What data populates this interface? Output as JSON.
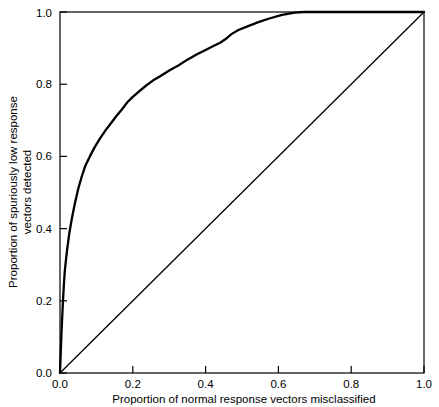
{
  "chart_data": {
    "type": "line",
    "title": "",
    "xlabel": "Proportion of normal response vectors misclassified",
    "ylabel": "Proportion of spuriously low response vectors detected",
    "ylabel_line1": "Proportion of spuriously low response",
    "ylabel_line2": "vectors detected",
    "xlim": [
      0.0,
      1.0
    ],
    "ylim": [
      0.0,
      1.0
    ],
    "grid": false,
    "legend": "none",
    "xticks": [
      "0.0",
      "0.2",
      "0.4",
      "0.6",
      "0.8",
      "1.0"
    ],
    "xtick_values": [
      0.0,
      0.2,
      0.4,
      0.6,
      0.8,
      1.0
    ],
    "yticks": [
      "0.0",
      "0.2",
      "0.4",
      "0.6",
      "0.8",
      "1.0"
    ],
    "ytick_values": [
      0.0,
      0.2,
      0.4,
      0.6,
      0.8,
      1.0
    ],
    "series": [
      {
        "name": "ROC curve",
        "x": [
          0.0,
          0.004,
          0.007,
          0.009,
          0.011,
          0.013,
          0.016,
          0.02,
          0.026,
          0.033,
          0.041,
          0.05,
          0.06,
          0.07,
          0.082,
          0.095,
          0.11,
          0.125,
          0.14,
          0.155,
          0.17,
          0.185,
          0.2,
          0.215,
          0.235,
          0.255,
          0.275,
          0.3,
          0.325,
          0.35,
          0.375,
          0.4,
          0.42,
          0.44,
          0.455,
          0.47,
          0.49,
          0.515,
          0.545,
          0.575,
          0.61,
          0.645,
          0.67,
          0.7,
          1.0
        ],
        "y": [
          0.0,
          0.11,
          0.175,
          0.215,
          0.25,
          0.28,
          0.31,
          0.345,
          0.39,
          0.43,
          0.47,
          0.51,
          0.545,
          0.575,
          0.6,
          0.625,
          0.65,
          0.672,
          0.692,
          0.712,
          0.73,
          0.75,
          0.765,
          0.778,
          0.795,
          0.81,
          0.822,
          0.838,
          0.852,
          0.868,
          0.882,
          0.895,
          0.905,
          0.915,
          0.925,
          0.938,
          0.95,
          0.96,
          0.972,
          0.982,
          0.992,
          0.998,
          1.0,
          1.0,
          1.0
        ]
      },
      {
        "name": "Chance diagonal",
        "x": [
          0.0,
          1.0
        ],
        "y": [
          0.0,
          1.0
        ]
      }
    ]
  },
  "axes": {
    "x_axis_label": "Proportion of normal response vectors misclassified",
    "y_axis_label_line1": "Proportion of spuriously low response",
    "y_axis_label_line2": "vectors detected",
    "x_tick_labels": [
      "0.0",
      "0.2",
      "0.4",
      "0.6",
      "0.8",
      "1.0"
    ],
    "y_tick_labels": [
      "0.0",
      "0.2",
      "0.4",
      "0.6",
      "0.8",
      "1.0"
    ]
  },
  "colors": {
    "background": "#ffffff",
    "ink": "#000000",
    "curve": "#000000",
    "diagonal": "#000000"
  }
}
